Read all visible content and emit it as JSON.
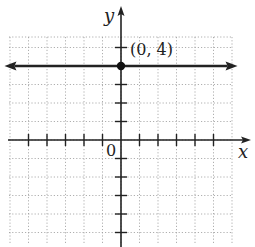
{
  "chart_data": {
    "type": "line",
    "title": "",
    "xlabel": "x",
    "ylabel": "y",
    "xlim": [
      -6,
      6
    ],
    "ylim": [
      -5,
      6
    ],
    "grid": true,
    "origin_label": "0",
    "series": [
      {
        "name": "y = 4",
        "kind": "horizontal-line",
        "y": 4,
        "x_range": [
          -6.3,
          6.3
        ],
        "arrows": "both",
        "color": "#222222"
      }
    ],
    "points": [
      {
        "x": 0,
        "y": 4,
        "label": "(0, 4)"
      }
    ]
  },
  "labels": {
    "x_axis": "x",
    "y_axis": "y",
    "origin": "0",
    "point": "(0, 4)"
  },
  "colors": {
    "axis": "#222222",
    "grid": "#9a9a9a",
    "line": "#222222"
  }
}
